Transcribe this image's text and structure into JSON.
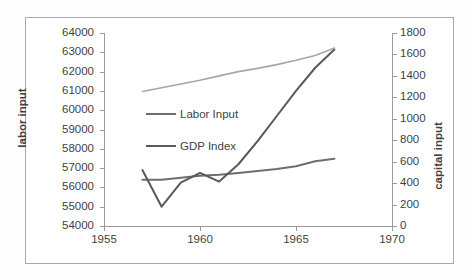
{
  "chart_data": {
    "type": "line",
    "title": "",
    "subtitle": "",
    "xlabel": "",
    "ylabel": "labor input",
    "y2label": "capital input",
    "xlim": [
      1955,
      1970
    ],
    "ylim": [
      54000,
      64000
    ],
    "y2lim": [
      0,
      1800
    ],
    "xticks": [
      1955,
      1960,
      1965,
      1970
    ],
    "yticks": [
      54000,
      55000,
      56000,
      57000,
      58000,
      59000,
      60000,
      61000,
      62000,
      63000,
      64000
    ],
    "y2ticks": [
      0,
      200,
      400,
      600,
      800,
      1000,
      1200,
      1400,
      1600,
      1800
    ],
    "grid": false,
    "legend_position": "inside-center-left",
    "x": [
      1957,
      1958,
      1959,
      1960,
      1961,
      1962,
      1963,
      1964,
      1965,
      1966,
      1967
    ],
    "series": [
      {
        "name": "Labor Input",
        "axis": "left",
        "color": "#6e6e6e",
        "values": [
          56400,
          56400,
          56500,
          56600,
          56650,
          56750,
          56850,
          56950,
          57100,
          57350,
          57480
        ]
      },
      {
        "name": "GDP Index",
        "axis": "left",
        "color": "#595959",
        "values": [
          56900,
          55000,
          56250,
          56750,
          56300,
          57200,
          58400,
          59700,
          61000,
          62200,
          63150
        ]
      },
      {
        "name": "capital input",
        "axis": "right",
        "color": "#a6a6a6",
        "values": [
          1255,
          1290,
          1325,
          1360,
          1400,
          1440,
          1470,
          1505,
          1545,
          1590,
          1660
        ]
      }
    ]
  },
  "axes": {
    "left_title": "labor input",
    "right_title": "capital input",
    "left_ticks": [
      "64000",
      "63000",
      "62000",
      "61000",
      "60000",
      "59000",
      "58000",
      "57000",
      "56000",
      "55000",
      "54000"
    ],
    "right_ticks": [
      "1800",
      "1600",
      "1400",
      "1200",
      "1000",
      "800",
      "600",
      "400",
      "200",
      "0"
    ],
    "bottom_ticks": [
      "1955",
      "1960",
      "1965",
      "1970"
    ]
  },
  "legend": {
    "items": [
      {
        "label": "Labor Input",
        "color": "#6e6e6e"
      },
      {
        "label": "GDP Index",
        "color": "#595959"
      }
    ]
  }
}
